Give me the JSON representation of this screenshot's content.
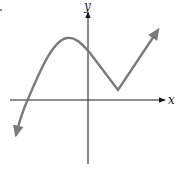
{
  "diagram": {
    "type": "function-graph",
    "axes": {
      "x_label": "x",
      "y_label": "y",
      "axis_color": "#1a1a1a"
    },
    "curve": {
      "color": "#7a7a7a",
      "description": "Continuous curve entering from lower-left (arrow), crossing x-axis left of origin, rising to a smooth local maximum left of the y-axis, descending through the positive y-axis to a sharp cusp (corner minimum) above the x-axis right of origin, then rising to upper-right (arrow)",
      "features": [
        {
          "name": "left-end",
          "direction": "down-left",
          "arrow": true
        },
        {
          "name": "x-intercept",
          "position": "left of origin"
        },
        {
          "name": "local-maximum",
          "shape": "smooth",
          "position": "left of y-axis, above x-axis"
        },
        {
          "name": "y-intercept",
          "position": "positive y"
        },
        {
          "name": "corner-minimum",
          "shape": "sharp cusp",
          "position": "right of y-axis, above x-axis"
        },
        {
          "name": "right-end",
          "direction": "up-right",
          "arrow": true
        }
      ]
    }
  }
}
